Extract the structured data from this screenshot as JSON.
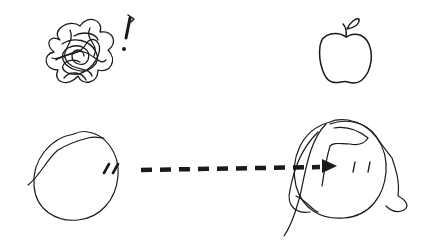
{
  "diagram": {
    "left_figure": {
      "label": "person-confused",
      "thought": "tangled-scribble",
      "exclamation": "!"
    },
    "right_figure": {
      "label": "person-thinking-apple",
      "thought": "apple"
    },
    "arrow": {
      "style": "dashed",
      "direction": "left-to-right",
      "meaning": "gaze"
    },
    "colors": {
      "ink": "#1a1a1a",
      "background": "#ffffff"
    }
  }
}
